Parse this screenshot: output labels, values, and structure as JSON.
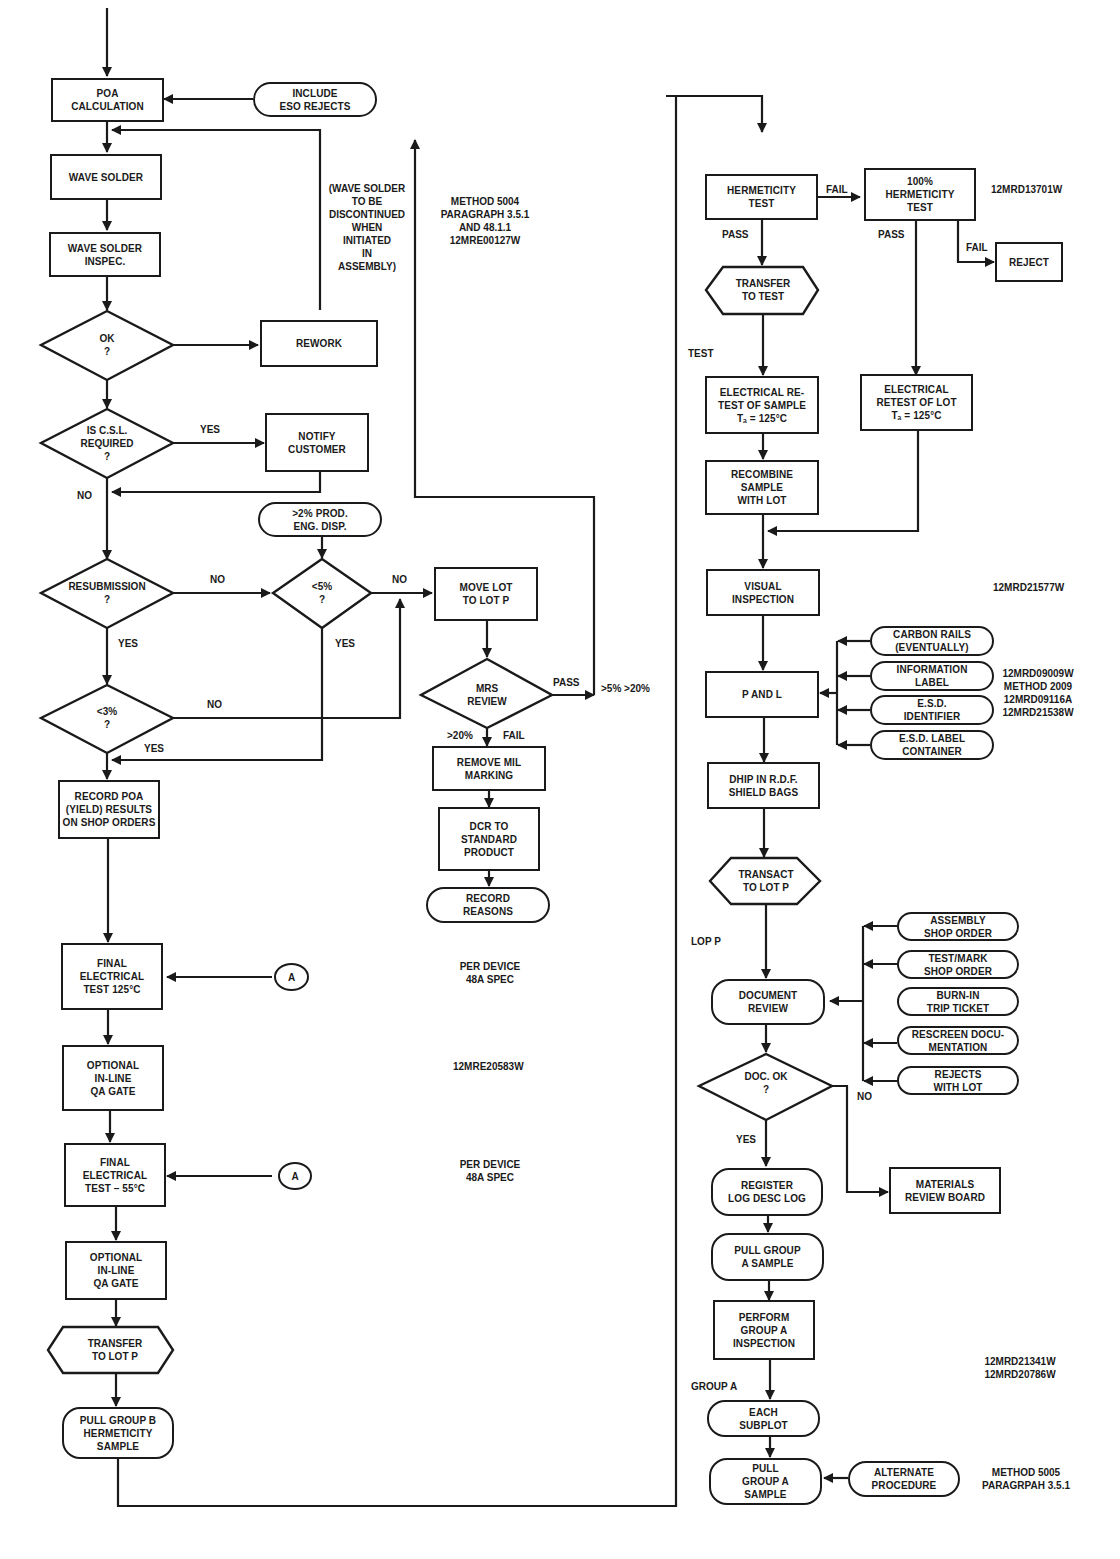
{
  "left_column": {
    "poa_calculation": "POA\nCALCULATION",
    "include_eso_rejects": "INCLUDE\nESO REJECTS",
    "wave_solder": "WAVE SOLDER",
    "wave_solder_inspec": "WAVE SOLDER\nINSPEC.",
    "ok_decision": "OK\n?",
    "rework": "REWORK",
    "wave_solder_note": "(WAVE SOLDER\nTO BE\nDISCONTINUED\nWHEN\nINITIATED\nIN\nASSEMBLY)",
    "csl_decision": "IS C.S.L.\nREQUIRED\n?",
    "csl_yes": "YES",
    "csl_no": "NO",
    "notify_customer": "NOTIFY\nCUSTOMER",
    "prod_eng_disp": ">2% PROD.\nENG. DISP.",
    "resubmission_decision": "RESUBMISSION\n?",
    "resub_no": "NO",
    "resub_yes": "YES",
    "lt5_decision": "<5%\n?",
    "lt5_no": "NO",
    "lt5_yes": "YES",
    "lt3_decision": "<3%\n?",
    "lt3_no": "NO",
    "lt3_yes": "YES",
    "record_poa": "RECORD POA\n(YIELD) RESULTS\nON SHOP ORDERS",
    "final_test_125": "FINAL\nELECTRICAL\nTEST 125°C",
    "connector_a1": "A",
    "per_device_1": "PER DEVICE\n48A SPEC",
    "optional_qa_1": "OPTIONAL\nIN-LINE\nQA GATE",
    "doc_ref_20583": "12MRE20583W",
    "final_test_55": "FINAL\nELECTRICAL\nTEST  – 55°C",
    "connector_a2": "A",
    "per_device_2": "PER DEVICE\n48A SPEC",
    "optional_qa_2": "OPTIONAL\nIN-LINE\nQA GATE",
    "transfer_lot_p": "TRANSFER\nTO LOT P",
    "pull_group_b": "PULL GROUP B\nHERMETICITY\nSAMPLE"
  },
  "middle_column": {
    "method_5004_note": "METHOD 5004\nPARAGRAPH 3.5.1\nAND 48.1.1\n12MRE00127W",
    "move_lot": "MOVE LOT\nTO LOT P",
    "move_lot_no": "NO",
    "mrs_review": "MRS\nREVIEW",
    "mrs_pass": "PASS",
    "mrs_pass_range": ">5% >20%",
    "mrs_fail": "FAIL",
    "mrs_fail_range": ">20%",
    "remove_mil_marking": "REMOVE MIL\nMARKING",
    "dcr_standard": "DCR TO\nSTANDARD\nPRODUCT",
    "record_reasons": "RECORD\nREASONS"
  },
  "right_column": {
    "hermeticity_test": "HERMETICITY\nTEST",
    "herm_fail": "FAIL",
    "herm_pass": "PASS",
    "hermeticity_100": "100%\nHERMETICITY\nTEST",
    "herm100_pass": "PASS",
    "herm100_fail": "FAIL",
    "doc_ref_13701": "12MRD13701W",
    "reject": "REJECT",
    "transfer_to_test": "TRANSFER\nTO TEST",
    "test_label": "TEST",
    "electrical_retest_sample": "ELECTRICAL RE-\nTEST OF SAMPLE\nTₐ = 125°C",
    "electrical_retest_lot": "ELECTRICAL\nRETEST OF LOT\nTₐ = 125°C",
    "recombine": "RECOMBINE\nSAMPLE\nWITH LOT",
    "visual_inspection": "VISUAL\nINSPECTION",
    "doc_ref_21577": "12MRD21577W",
    "p_and_l": "P AND L",
    "carbon_rails": "CARBON RAILS\n(EVENTUALLY)",
    "information_label": "INFORMATION\nLABEL",
    "esd_identifier": "E.S.D.\nIDENTIFIER",
    "esd_label_container": "E.S.D. LABEL\nCONTAINER",
    "pl_refs": "12MRD09009W\nMETHOD 2009\n12MRD09116A\n12MRD21538W",
    "ship_shield_bags": "DHIP IN R.D.F.\nSHIELD BAGS",
    "transact_lot_p": "TRANSACT\nTO LOT P",
    "lop_p_label": "LOP P",
    "document_review": "DOCUMENT\nREVIEW",
    "assembly_shop_order": "ASSEMBLY\nSHOP ORDER",
    "test_mark_shop_order": "TEST/MARK\nSHOP ORDER",
    "burn_in_trip_ticket": "BURN-IN\nTRIP TICKET",
    "rescreen_documentation": "RESCREEN DOCU-\nMENTATION",
    "rejects_with_lot": "REJECTS\nWITH LOT",
    "doc_ok_decision": "DOC. OK\n?",
    "doc_ok_yes": "YES",
    "doc_ok_no": "NO",
    "materials_review_board": "MATERIALS\nREVIEW BOARD",
    "register_log": "REGISTER\nLOG DESC LOG",
    "pull_group_a_sample_1": "PULL GROUP\nA SAMPLE",
    "perform_group_a": "PERFORM\nGROUP A\nINSPECTION",
    "group_a_refs": "12MRD21341W\n12MRD20786W",
    "group_a_label": "GROUP A",
    "each_subplot": "EACH\nSUBPLOT",
    "pull_group_a_sample_2": "PULL\nGROUP A\nSAMPLE",
    "alternate_procedure": "ALTERNATE\nPROCEDURE",
    "method_5005_note": "METHOD 5005\nPARAGRPAH 3.5.1"
  }
}
